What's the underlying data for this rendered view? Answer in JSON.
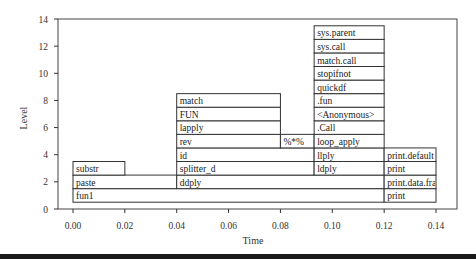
{
  "chart_data": {
    "type": "flame-graph",
    "title": "",
    "xlabel": "Time",
    "ylabel": "Level",
    "xlim": [
      -0.005,
      0.146
    ],
    "ylim": [
      0,
      14
    ],
    "xticks": [
      "0.00",
      "0.02",
      "0.04",
      "0.06",
      "0.08",
      "0.10",
      "0.12",
      "0.14"
    ],
    "yticks": [
      "0",
      "2",
      "4",
      "6",
      "8",
      "10",
      "12",
      "14"
    ],
    "grid": false,
    "blocks": [
      {
        "label": "fun1",
        "level": 1,
        "start": 0.0,
        "end": 0.12
      },
      {
        "label": "print",
        "level": 1,
        "start": 0.12,
        "end": 0.14
      },
      {
        "label": "paste",
        "level": 2,
        "start": 0.0,
        "end": 0.04
      },
      {
        "label": "ddply",
        "level": 2,
        "start": 0.04,
        "end": 0.12
      },
      {
        "label": "print.data.frame",
        "level": 2,
        "start": 0.12,
        "end": 0.14
      },
      {
        "label": "substr",
        "level": 3,
        "start": 0.0,
        "end": 0.02
      },
      {
        "label": "splitter_d",
        "level": 3,
        "start": 0.04,
        "end": 0.093
      },
      {
        "label": "ldply",
        "level": 3,
        "start": 0.093,
        "end": 0.12
      },
      {
        "label": "print",
        "level": 3,
        "start": 0.12,
        "end": 0.14
      },
      {
        "label": "id",
        "level": 4,
        "start": 0.04,
        "end": 0.093
      },
      {
        "label": "llply",
        "level": 4,
        "start": 0.093,
        "end": 0.12
      },
      {
        "label": "print.default",
        "level": 4,
        "start": 0.12,
        "end": 0.14
      },
      {
        "label": "rev",
        "level": 5,
        "start": 0.04,
        "end": 0.08
      },
      {
        "label": "%*%",
        "level": 5,
        "start": 0.08,
        "end": 0.093
      },
      {
        "label": "loop_apply",
        "level": 5,
        "start": 0.093,
        "end": 0.12
      },
      {
        "label": "lapply",
        "level": 6,
        "start": 0.04,
        "end": 0.08
      },
      {
        "label": ".Call",
        "level": 6,
        "start": 0.093,
        "end": 0.12
      },
      {
        "label": "FUN",
        "level": 7,
        "start": 0.04,
        "end": 0.08
      },
      {
        "label": "<Anonymous>",
        "level": 7,
        "start": 0.093,
        "end": 0.12
      },
      {
        "label": "match",
        "level": 8,
        "start": 0.04,
        "end": 0.08
      },
      {
        "label": ".fun",
        "level": 8,
        "start": 0.093,
        "end": 0.12
      },
      {
        "label": "quickdf",
        "level": 9,
        "start": 0.093,
        "end": 0.12
      },
      {
        "label": "stopifnot",
        "level": 10,
        "start": 0.093,
        "end": 0.12
      },
      {
        "label": "match.call",
        "level": 11,
        "start": 0.093,
        "end": 0.12
      },
      {
        "label": "sys.call",
        "level": 12,
        "start": 0.093,
        "end": 0.12
      },
      {
        "label": "sys.parent",
        "level": 13,
        "start": 0.093,
        "end": 0.12
      }
    ]
  },
  "axes": {
    "xlabel": "Time",
    "ylabel": "Level"
  }
}
